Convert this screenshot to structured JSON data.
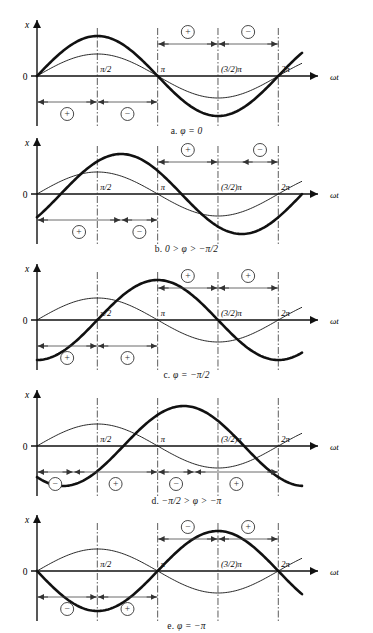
{
  "figure": {
    "type": "line",
    "axis": {
      "y_label": "x",
      "x_label": "ωt",
      "origin_label": "0",
      "ticks": [
        "π/2",
        "π",
        "(3/2)π",
        "2π"
      ],
      "tick_values": [
        1.5707963,
        3.1415927,
        4.712389,
        6.2831853
      ],
      "x_range": [
        0,
        6.9
      ],
      "y_range": [
        -1.15,
        1.15
      ],
      "grid": false,
      "legend": "none"
    },
    "marks": {
      "plus": "⊕",
      "minus": "⊖"
    },
    "panels": [
      {
        "id": "a",
        "label": "a.",
        "caption": "φ = 0",
        "phi": 0,
        "ref_amp": 0.55,
        "main_amp": 1.0,
        "upper_regions": [
          {
            "from": 3.1415927,
            "to": 4.712389,
            "sign": "⊕"
          },
          {
            "from": 4.712389,
            "to": 6.2831853,
            "sign": "⊖"
          }
        ],
        "lower_regions": [
          {
            "from": 0,
            "to": 1.5707963,
            "sign": "⊕"
          },
          {
            "from": 1.5707963,
            "to": 3.1415927,
            "sign": "⊖"
          }
        ]
      },
      {
        "id": "b",
        "label": "b.",
        "caption": "0 > φ > −π/2",
        "phi": -0.62,
        "ref_amp": 0.55,
        "main_amp": 1.0,
        "upper_regions": [
          {
            "from": 3.1415927,
            "to": 4.712389,
            "sign": "⊕"
          },
          {
            "from": 5.33,
            "to": 6.2831853,
            "sign": "⊖"
          }
        ],
        "lower_regions": [
          {
            "from": 0,
            "to": 2.19,
            "sign": "⊕"
          },
          {
            "from": 2.19,
            "to": 3.1415927,
            "sign": "⊖"
          }
        ]
      },
      {
        "id": "c",
        "label": "c.",
        "caption": "φ = −π/2",
        "phi": -1.5707963,
        "ref_amp": 0.55,
        "main_amp": 1.0,
        "upper_regions": [
          {
            "from": 3.1415927,
            "to": 4.712389,
            "sign": "⊕"
          },
          {
            "from": 4.712389,
            "to": 6.2831853,
            "sign": "⊕"
          }
        ],
        "lower_regions": [
          {
            "from": 0,
            "to": 1.5707963,
            "sign": "⊕"
          },
          {
            "from": 1.5707963,
            "to": 3.1415927,
            "sign": "⊕"
          }
        ]
      },
      {
        "id": "d",
        "label": "d.",
        "caption": "−π/2 > φ > −π",
        "phi": -2.25,
        "ref_amp": 0.55,
        "main_amp": 1.0,
        "upper_regions": [],
        "lower_regions": [
          {
            "from": 0,
            "to": 0.95,
            "sign": "⊖"
          },
          {
            "from": 0.95,
            "to": 3.1415927,
            "sign": "⊕"
          },
          {
            "from": 3.1415927,
            "to": 4.1,
            "sign": "⊖"
          },
          {
            "from": 4.1,
            "to": 6.2831853,
            "sign": "⊕"
          }
        ]
      },
      {
        "id": "e",
        "label": "e.",
        "caption": "φ = −π",
        "phi": -3.1415927,
        "ref_amp": 0.55,
        "main_amp": 1.0,
        "upper_regions": [
          {
            "from": 3.1415927,
            "to": 4.712389,
            "sign": "⊖"
          },
          {
            "from": 4.712389,
            "to": 6.2831853,
            "sign": "⊕"
          }
        ],
        "lower_regions": [
          {
            "from": 0,
            "to": 1.5707963,
            "sign": "⊖"
          },
          {
            "from": 1.5707963,
            "to": 3.1415927,
            "sign": "⊕"
          }
        ]
      }
    ]
  }
}
